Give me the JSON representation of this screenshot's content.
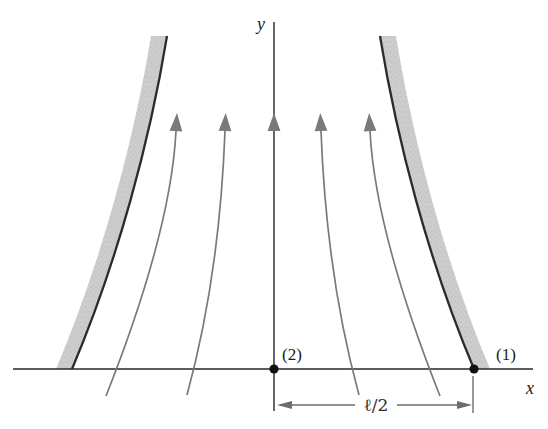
{
  "figure": {
    "labels": {
      "y_axis": "y",
      "x_axis": "x",
      "point_1": "(1)",
      "point_2": "(2)",
      "dimension": "ℓ/2"
    },
    "colors": {
      "background": "#ffffff",
      "ink": "#262626",
      "streamline_gray": "#7a7a7a",
      "dimension_gray": "#6d6d6d",
      "wall_fill": "#cdcdcd",
      "wall_edge": "#2b2b2b",
      "point_dot": "#111111"
    }
  }
}
